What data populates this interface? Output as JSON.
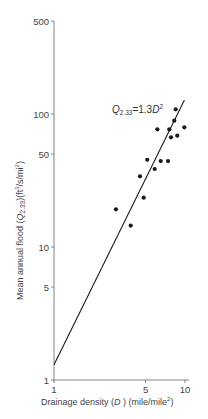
{
  "chart_data": {
    "type": "scatter",
    "title": "",
    "xlabel": "Drainage density (D) (mile/mile²)",
    "ylabel": "Mean annual flood (Q2.33)(ft³/s/mi²)",
    "xscale": "log",
    "yscale": "log",
    "xlim": [
      1,
      10
    ],
    "ylim": [
      1,
      500
    ],
    "x_ticks": [
      1,
      5,
      10
    ],
    "y_ticks": [
      1,
      5,
      10,
      50,
      100,
      500
    ],
    "grid": false,
    "legend": null,
    "annotation": "Q2.33 = 1.3D²",
    "fit_line": {
      "equation": "Q2.33 = 1.3D^2",
      "coef": 1.3,
      "exponent": 2,
      "x_range": [
        1,
        9.9
      ]
    },
    "series": [
      {
        "name": "Observations",
        "x": [
          2.97,
          3.85,
          4.84,
          4.53,
          5.15,
          5.87,
          6.53,
          7.42,
          6.15,
          7.59,
          7.82,
          8.73,
          9.88,
          8.28,
          8.49
        ],
        "y": [
          19.2,
          14.5,
          23.5,
          34.0,
          45.3,
          38.6,
          44.3,
          44.3,
          76.7,
          76.7,
          66.8,
          68.7,
          79.4,
          89.1,
          108.5
        ]
      }
    ]
  },
  "labels": {
    "x_axis_title_pre": "Drainage density (",
    "x_axis_var": "D",
    "x_axis_title_post": " ) (mile/mile",
    "x_axis_sup": "2",
    "x_axis_close": ")",
    "y_axis_title_pre": "Mean annual flood (",
    "y_axis_var": "Q",
    "y_axis_sub": "2.33",
    "y_axis_title_mid": ")(ft",
    "y_axis_sup1": "3",
    "y_axis_title_mid2": "/s/mi",
    "y_axis_sup2": "2",
    "y_axis_close": ")",
    "eq_var": "Q",
    "eq_sub": "2.33",
    "eq_mid": "=1.3",
    "eq_var2": "D",
    "eq_sup": "2"
  },
  "x_tick_labels": [
    "1",
    "5",
    "10"
  ],
  "y_tick_labels": [
    "1",
    "5",
    "10",
    "50",
    "100",
    "500"
  ],
  "colors": {
    "axis": "#777777",
    "ink": "#1a1a1a",
    "text": "#444444"
  }
}
